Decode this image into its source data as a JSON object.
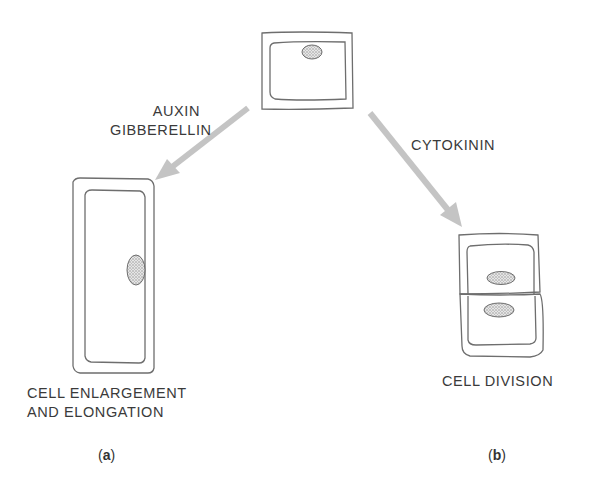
{
  "labels": {
    "hormone_left_line1": "AUXIN",
    "hormone_left_line2": "GIBBERELLIN",
    "hormone_right": "CYTOKININ",
    "outcome_left_line1": "CELL ENLARGEMENT",
    "outcome_left_line2": "AND ELONGATION",
    "outcome_right": "CELL DIVISION",
    "panel_a_open": "(",
    "panel_a_letter": "a",
    "panel_a_close": ")",
    "panel_b_open": "(",
    "panel_b_letter": "b",
    "panel_b_close": ")"
  },
  "colors": {
    "line": "#6e6e6e",
    "arrow": "#c4c4c4",
    "nucleus_fill": "#bdbdbd",
    "text": "#3a3a3a"
  }
}
